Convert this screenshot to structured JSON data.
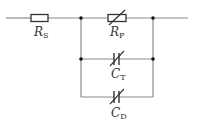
{
  "diagram": {
    "type": "circuit",
    "colors": {
      "wire": "#8a8a8a",
      "component": "#333333",
      "node": "#111111",
      "background": "#ffffff"
    },
    "components": [
      {
        "id": "RS",
        "kind": "resistor",
        "label_main": "R",
        "label_sub": "S"
      },
      {
        "id": "RP",
        "kind": "variable-resistor",
        "label_main": "R",
        "label_sub": "P"
      },
      {
        "id": "CT",
        "kind": "variable-capacitor",
        "label_main": "C",
        "label_sub": "T"
      },
      {
        "id": "CD",
        "kind": "variable-capacitor",
        "label_main": "C",
        "label_sub": "D"
      }
    ],
    "topology": "R_S in series with parallel combination of R_P, C_T and C_D"
  }
}
